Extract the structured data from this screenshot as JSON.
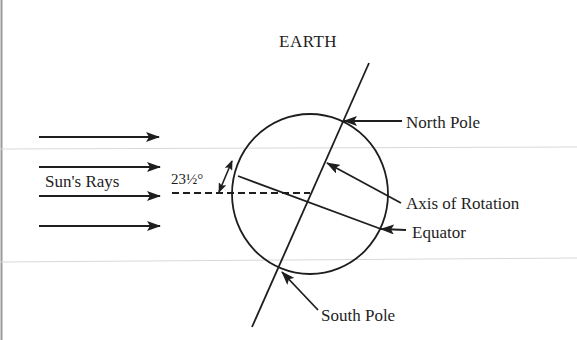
{
  "diagram": {
    "title": "EARTH",
    "labels": {
      "sun_rays": "Sun's Rays",
      "tilt_angle": "23½°",
      "north_pole": "North Pole",
      "axis_of_rotation": "Axis of Rotation",
      "equator": "Equator",
      "south_pole": "South Pole"
    },
    "elements": {
      "sun_ray_arrows": 4,
      "earth_circle": {
        "cx": 310,
        "cy": 194,
        "rx": 78,
        "ry": 80
      },
      "axial_tilt_degrees": "23½"
    },
    "colors": {
      "ink": "#1e1e1e",
      "background": "#ffffff",
      "scan_lines": "#d8d8d8"
    }
  }
}
